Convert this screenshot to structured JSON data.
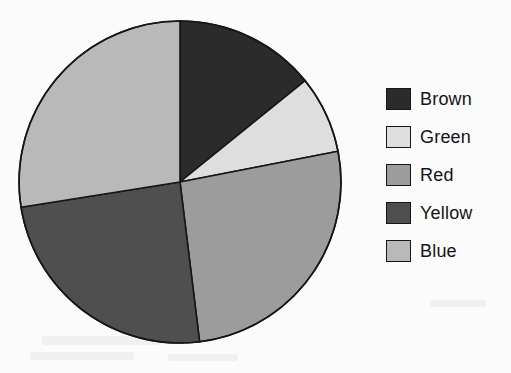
{
  "canvas": {
    "width": 511,
    "height": 373,
    "background": "#fbfbfb"
  },
  "pie": {
    "center_x": 180,
    "center_y": 182,
    "radius": 161,
    "outline_color": "#161616",
    "outline_width": 1.6,
    "start_angle_deg": 0
  },
  "legend": {
    "items": [
      {
        "label": "Brown",
        "color": "#2b2b2b"
      },
      {
        "label": "Green",
        "color": "#dedede"
      },
      {
        "label": "Red",
        "color": "#9c9c9c"
      },
      {
        "label": "Yellow",
        "color": "#4f4f4f"
      },
      {
        "label": "Blue",
        "color": "#b9b9b9"
      }
    ]
  },
  "chart_data": {
    "type": "pie",
    "title": "",
    "labels": [
      "Brown",
      "Green",
      "Red",
      "Yellow",
      "Blue"
    ],
    "values": [
      14.2,
      7.8,
      26.1,
      24.4,
      27.5
    ],
    "units": "percent",
    "colors": [
      "#2b2b2b",
      "#dedede",
      "#9c9c9c",
      "#4f4f4f",
      "#b9b9b9"
    ],
    "start_angle_deg": 0,
    "direction": "clockwise",
    "slice_angles_deg": [
      {
        "label": "Brown",
        "start": 0,
        "end": 51,
        "sweep": 51
      },
      {
        "label": "Green",
        "start": 51,
        "end": 79,
        "sweep": 28
      },
      {
        "label": "Red",
        "start": 79,
        "end": 173,
        "sweep": 94
      },
      {
        "label": "Yellow",
        "start": 173,
        "end": 261,
        "sweep": 88
      },
      {
        "label": "Blue",
        "start": 261,
        "end": 360,
        "sweep": 99
      }
    ],
    "legend_position": "right",
    "grid": false,
    "xlabel": "",
    "ylabel": ""
  }
}
